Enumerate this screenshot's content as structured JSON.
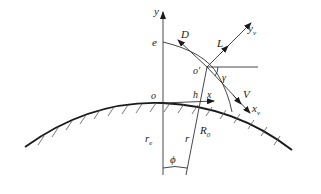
{
  "diagram": {
    "type": "geometry",
    "colors": {
      "line": "#1a1a1a",
      "background": "#ffffff"
    },
    "labels": {
      "y_axis": "y",
      "e_point": "e",
      "D_vector": "D",
      "L_vector": "L",
      "yv_axis_main": "y",
      "yv_axis_sub": "v",
      "o_prime": "o′",
      "gamma_angle": "γ",
      "o_origin": "o",
      "h_height": "h",
      "x_axis": "x",
      "V_vector": "V",
      "xv_axis_main": "x",
      "xv_axis_sub": "v",
      "re_radius_main": "r",
      "re_radius_sub": "e",
      "r_radius": "r",
      "R0_main": "R",
      "R0_sub": "0",
      "phi_angle": "ϕ"
    }
  }
}
